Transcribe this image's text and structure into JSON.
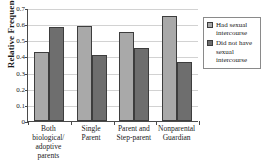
{
  "chart_data": {
    "type": "bar",
    "title": "",
    "xlabel": "",
    "ylabel": "Relative Frequency",
    "ylim": [
      0,
      0.7
    ],
    "yticks": [
      "0",
      "0.1",
      "0.2",
      "0.3",
      "0.4",
      "0.5",
      "0.6",
      "0.7"
    ],
    "ytick_values": [
      0,
      0.1,
      0.2,
      0.3,
      0.4,
      0.5,
      0.6,
      0.7
    ],
    "grid": true,
    "legend_position": "right",
    "categories": [
      "Both biological/ adoptive parents",
      "Single Parent",
      "Parent and Step-parent",
      "Nonparental Guardian"
    ],
    "category_lines": [
      [
        "Both",
        "biological/",
        "adoptive",
        "parents"
      ],
      [
        "Single",
        "Parent"
      ],
      [
        "Parent and",
        "Step-parent"
      ],
      [
        "Nonparental",
        "Guardian"
      ]
    ],
    "series": [
      {
        "name": "Had sexual intercourse",
        "color": "#a9a9a9",
        "values": [
          0.43,
          0.59,
          0.55,
          0.65
        ]
      },
      {
        "name": "Did not have sexual intercourse",
        "color": "#6e6e6e",
        "values": [
          0.58,
          0.41,
          0.45,
          0.365
        ]
      }
    ]
  },
  "legend": {
    "items": [
      {
        "label": "Had sexual intercourse",
        "color": "#a9a9a9"
      },
      {
        "label": "Did not have sexual intercourse",
        "color": "#6e6e6e"
      }
    ]
  },
  "colors": {
    "series_light": "#a9a9a9",
    "series_dark": "#6e6e6e",
    "axis": "#4a4a4a",
    "grid": "#d2d2d2",
    "background": "#ffffff"
  }
}
